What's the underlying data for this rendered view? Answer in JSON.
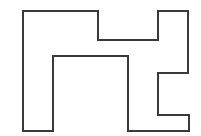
{
  "figure": {
    "name": "rectilinear-polygon-outline",
    "background_color": "#ffffff",
    "stroke_color": "#3a3a3a",
    "fill_color": "#ffffff",
    "stroke_width": 2,
    "canvas": {
      "width": 201,
      "height": 136
    },
    "vertices": [
      [
        23,
        11
      ],
      [
        98,
        11
      ],
      [
        98,
        40
      ],
      [
        158,
        40
      ],
      [
        158,
        11
      ],
      [
        188,
        11
      ],
      [
        188,
        73
      ],
      [
        158,
        73
      ],
      [
        158,
        115
      ],
      [
        189,
        115
      ],
      [
        189,
        131
      ],
      [
        128,
        131
      ],
      [
        128,
        56
      ],
      [
        53,
        56
      ],
      [
        53,
        131
      ],
      [
        23,
        131
      ]
    ],
    "vertex_count": 16,
    "closed": true
  }
}
